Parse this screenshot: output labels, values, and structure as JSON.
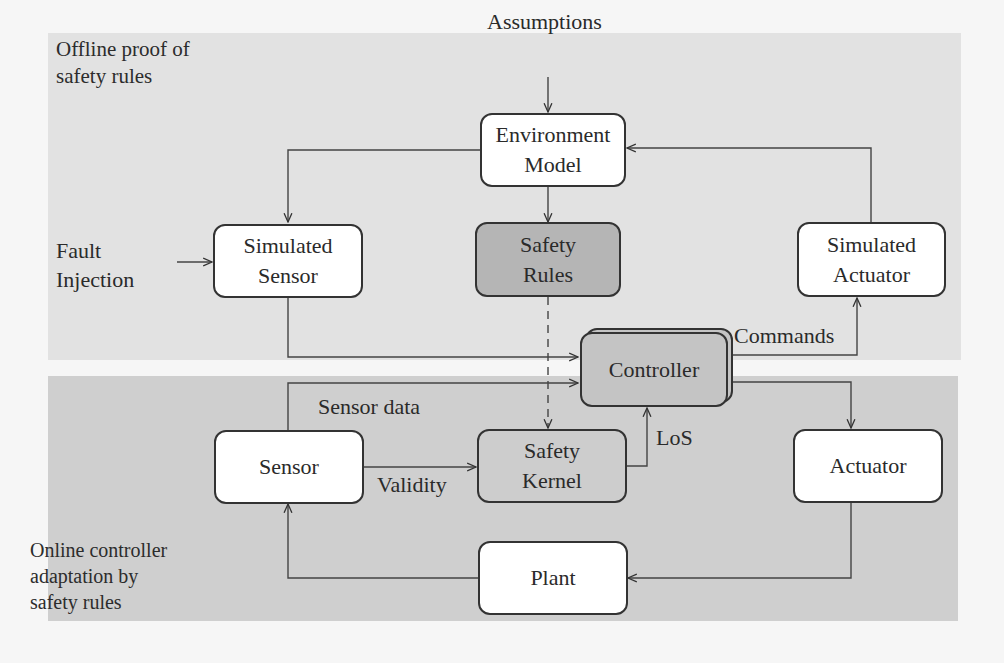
{
  "regions": {
    "offline": {
      "label": "Offline proof of\nsafety rules",
      "color": "#e2e2e2"
    },
    "online": {
      "label": "Online controller\nadaptation by\nsafety rules",
      "color": "#cfcfcf"
    }
  },
  "nodes": {
    "environment_model": {
      "label": "Environment\nModel",
      "fill": "white"
    },
    "simulated_sensor": {
      "label": "Simulated\nSensor",
      "fill": "white"
    },
    "safety_rules": {
      "label": "Safety\nRules",
      "fill": "grey"
    },
    "simulated_actuator": {
      "label": "Simulated\nActuator",
      "fill": "white"
    },
    "controller": {
      "label": "Controller",
      "fill": "grey"
    },
    "sensor": {
      "label": "Sensor",
      "fill": "white"
    },
    "safety_kernel": {
      "label": "Safety\nKernel",
      "fill": "grey"
    },
    "actuator": {
      "label": "Actuator",
      "fill": "white"
    },
    "plant": {
      "label": "Plant",
      "fill": "white"
    }
  },
  "inputs": {
    "assumptions": "Assumptions",
    "fault_injection": "Fault\nInjection"
  },
  "edge_labels": {
    "commands": "Commands",
    "sensor_data": "Sensor data",
    "validity": "Validity",
    "los": "LoS"
  },
  "edges": [
    {
      "from": "Assumptions",
      "to": "Environment Model",
      "style": "solid"
    },
    {
      "from": "Environment Model",
      "to": "Simulated Sensor",
      "style": "solid"
    },
    {
      "from": "Environment Model",
      "to": "Safety Rules",
      "style": "solid"
    },
    {
      "from": "Simulated Actuator",
      "to": "Environment Model",
      "style": "solid"
    },
    {
      "from": "Fault Injection",
      "to": "Simulated Sensor",
      "style": "solid"
    },
    {
      "from": "Simulated Sensor",
      "to": "Controller",
      "style": "solid"
    },
    {
      "from": "Controller",
      "to": "Simulated Actuator",
      "style": "solid",
      "label": "Commands"
    },
    {
      "from": "Safety Rules",
      "to": "Safety Kernel",
      "style": "dashed"
    },
    {
      "from": "Sensor",
      "to": "Controller",
      "style": "solid",
      "label": "Sensor data"
    },
    {
      "from": "Sensor",
      "to": "Safety Kernel",
      "style": "solid",
      "label": "Validity"
    },
    {
      "from": "Safety Kernel",
      "to": "Controller",
      "style": "solid",
      "label": "LoS"
    },
    {
      "from": "Controller",
      "to": "Actuator",
      "style": "solid"
    },
    {
      "from": "Actuator",
      "to": "Plant",
      "style": "solid"
    },
    {
      "from": "Plant",
      "to": "Sensor",
      "style": "solid"
    }
  ]
}
